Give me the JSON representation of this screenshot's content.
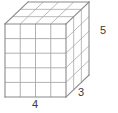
{
  "figure": {
    "name": "rectangular-prism-unit-cube-grid",
    "shape": "rectangular prism",
    "background_color": "#ffffff",
    "edge_color": "#8a8a8a",
    "grid_color": "#a8a8a8",
    "label_color": "#3b3b3b"
  },
  "labels": {
    "width": "4",
    "depth": "3",
    "height": "5"
  },
  "dimensions": {
    "width_units": 4,
    "depth_units": 3,
    "height_units": 5
  },
  "geometry": {
    "front_face": {
      "origin_x": 5,
      "origin_y": 24,
      "width_px": 61,
      "height_px": 73,
      "columns": 4,
      "rows": 5
    },
    "depth_offset": {
      "dx": 23,
      "dy": -22,
      "steps": 3
    }
  }
}
